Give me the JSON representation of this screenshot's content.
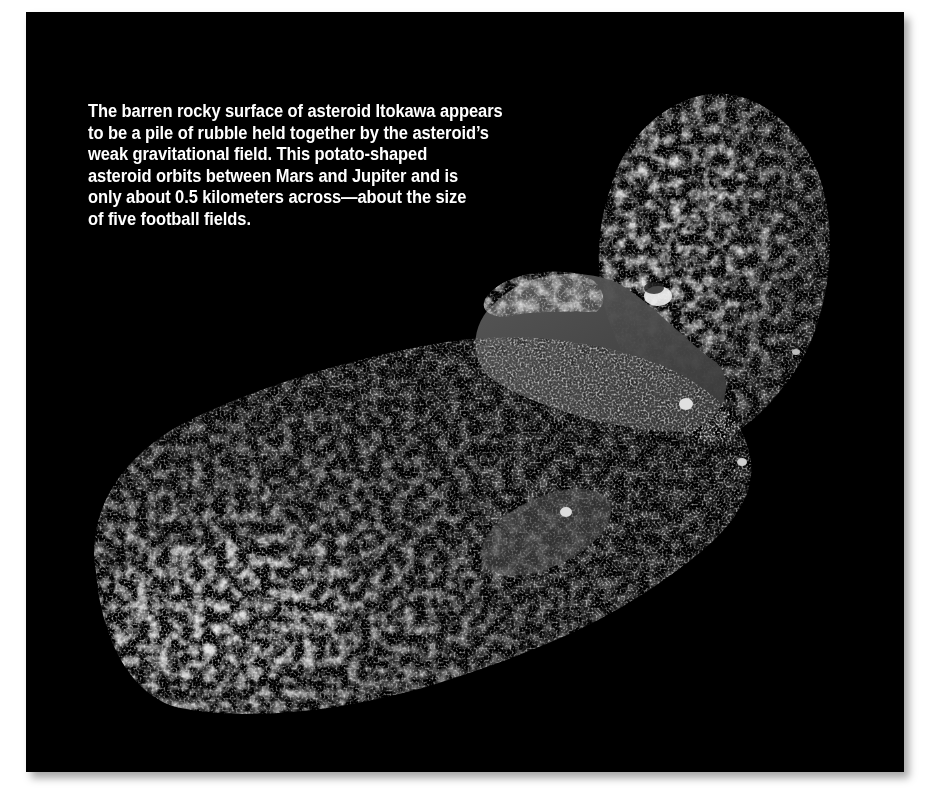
{
  "figure": {
    "subject": "Asteroid Itokawa",
    "background_color": "#000000",
    "caption_color": "#ffffff",
    "caption_lines": [
      "The barren rocky surface of asteroid Itokawa appears",
      "to be a pile of rubble held together by the asteroid’s",
      "weak gravitational field.  This potato-shaped",
      "asteroid orbits between Mars and Jupiter and is",
      "only about 0.5 kilometers across—about the size",
      "of five football fields."
    ]
  }
}
